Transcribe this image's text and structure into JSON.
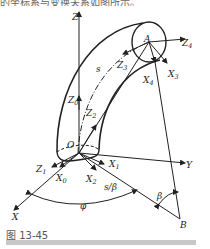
{
  "top_text": "的坐标系与变换关系如图所示。",
  "caption": "图 13-45",
  "labels": {
    "Z": "Z",
    "Y": "Y",
    "X": "X",
    "O": "O",
    "A": "A",
    "B": "B",
    "Z0": "Z",
    "Z0_sub": "0",
    "Z1": "Z",
    "Z1_sub": "1",
    "Z2": "Z",
    "Z2_sub": "2",
    "Z3": "Z",
    "Z3_sub": "3",
    "Z4": "Z",
    "Z4_sub": "4",
    "X0": "X",
    "X0_sub": "0",
    "X1": "X",
    "X1_sub": "1",
    "X2": "X",
    "X2_sub": "2",
    "X3": "X",
    "X3_sub": "3",
    "X4": "X",
    "X4_sub": "4",
    "s": "s",
    "s_beta": "s/β",
    "beta": "β",
    "phi": "φ"
  }
}
